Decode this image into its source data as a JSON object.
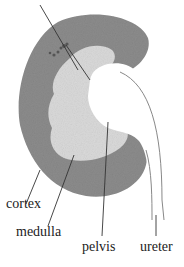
{
  "diagram": {
    "labels": {
      "cortex": "cortex",
      "medulla": "medulla",
      "pelvis": "pelvis",
      "ureter": "ureter"
    },
    "colors": {
      "cortex": "#8f8f8f",
      "medulla": "#d9d9d9",
      "pelvis": "#ffffff",
      "lines": "#333333"
    }
  }
}
